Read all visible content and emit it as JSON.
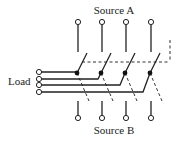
{
  "diagram": {
    "labels": {
      "source_a": "Source A",
      "source_b": "Source B",
      "load": "Load"
    },
    "poles": 4,
    "pole_x": [
      78,
      102,
      126,
      151
    ],
    "colors": {
      "line": "#222222",
      "background": "#ffffff"
    }
  }
}
